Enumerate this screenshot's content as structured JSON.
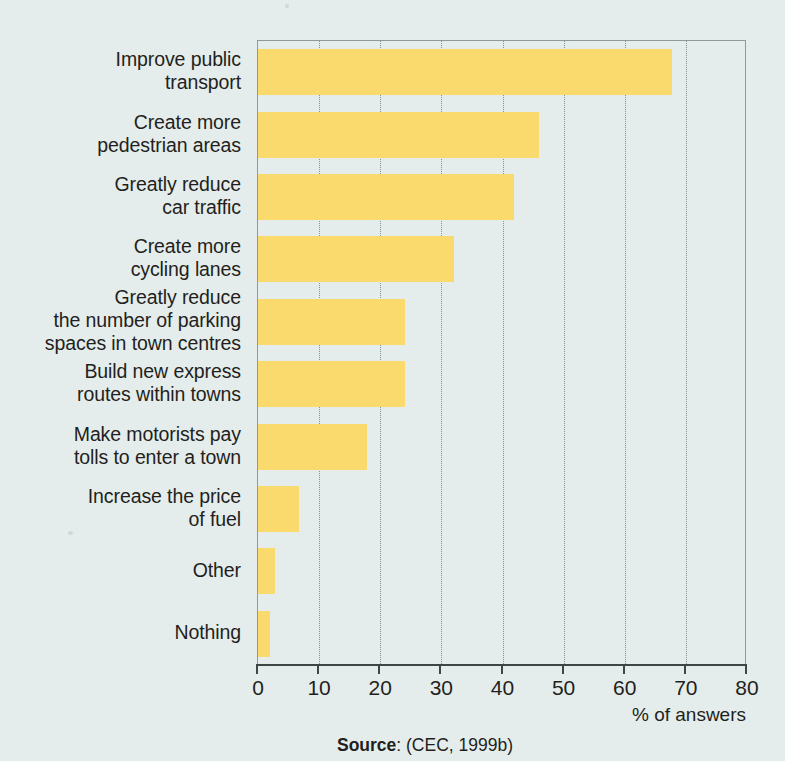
{
  "chart_data": {
    "type": "bar",
    "orientation": "horizontal",
    "title": "",
    "subtitle": "",
    "xlabel": "% of answers",
    "ylabel": "",
    "xlim": [
      0,
      80
    ],
    "xticks": [
      0,
      10,
      20,
      30,
      40,
      50,
      60,
      70,
      80
    ],
    "xtick_labels": [
      "0",
      "10",
      "20",
      "30",
      "40",
      "50",
      "60",
      "70",
      "80"
    ],
    "grid": "vertical-dotted",
    "legend": "none",
    "bar_color": "#fad96d",
    "background_color": "#e5edec",
    "axis_color": "#3d4547",
    "categories": [
      "Improve public\ntransport",
      "Create more\npedestrian areas",
      "Greatly reduce\ncar traffic",
      "Create more\ncycling lanes",
      "Greatly reduce\nthe number of parking\nspaces in town centres",
      "Build new express\nroutes within towns",
      "Make motorists pay\ntolls to enter a town",
      "Increase the price\nof fuel",
      "Other",
      "Nothing"
    ],
    "values": [
      67.7,
      45.9,
      41.8,
      32.0,
      24.0,
      24.0,
      17.9,
      6.7,
      2.8,
      2.0
    ],
    "source_label": "Source",
    "source_text": ": (CEC, 1999b)"
  }
}
